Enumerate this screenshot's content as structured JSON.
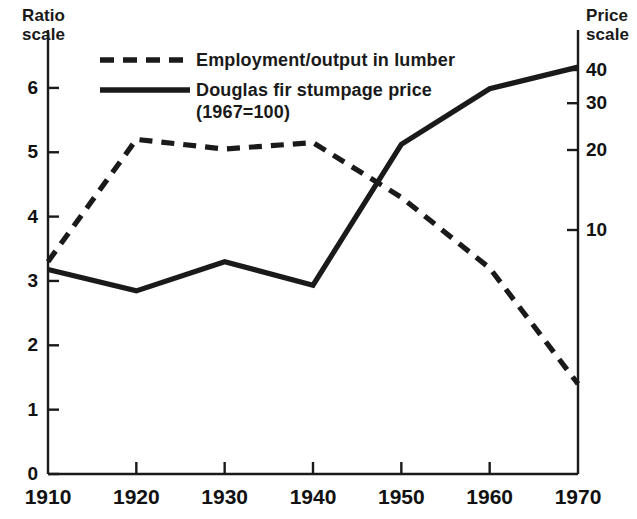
{
  "figure": {
    "background_color": "#ffffff",
    "ink_color": "#1a1a1a",
    "width": 637,
    "height": 519
  },
  "left_axis": {
    "title_line1": "Ratio",
    "title_line2": "scale",
    "ticks": [
      "6",
      "5",
      "4",
      "3",
      "2",
      "1",
      "0"
    ]
  },
  "right_axis": {
    "title_line1": "Price",
    "title_line2": "scale",
    "ticks": [
      "40",
      "30",
      "20",
      "10"
    ]
  },
  "x_axis": {
    "ticks": [
      "1910",
      "1920",
      "1930",
      "1940",
      "1950",
      "1960",
      "1970"
    ]
  },
  "legend": {
    "items": [
      {
        "style": "dashed",
        "label": "Employment/output in lumber"
      },
      {
        "style": "solid",
        "label": "Douglas fir stumpage price"
      }
    ],
    "note": "(1967=100)"
  },
  "chart_data": {
    "type": "line",
    "title": "",
    "subtitle": "",
    "xlabel": "",
    "ylabel": "Ratio scale",
    "y2label": "Price scale",
    "grid": false,
    "legend_position": "top-left",
    "x": [
      1910,
      1920,
      1930,
      1940,
      1950,
      1960,
      1970
    ],
    "xlim": [
      1910,
      1970
    ],
    "ylim": [
      0,
      6.9
    ],
    "y_ticks": [
      0,
      1,
      2,
      3,
      4,
      5,
      6
    ],
    "y2_scale": "log",
    "y2lim": [
      2.4,
      46
    ],
    "y2_ticks": [
      10,
      20,
      30,
      40
    ],
    "series": [
      {
        "name": "Employment/output in lumber",
        "style": "dashed",
        "axis": "left",
        "color": "#1a1a1a",
        "values": [
          3.3,
          5.2,
          5.05,
          5.15,
          4.3,
          3.2,
          1.4
        ]
      },
      {
        "name": "Douglas fir stumpage price (1967=100)",
        "style": "solid",
        "axis": "right",
        "color": "#1a1a1a",
        "values": [
          7.1,
          5.9,
          7.6,
          6.2,
          21.0,
          34.0,
          41.0
        ]
      }
    ],
    "annotations": []
  }
}
